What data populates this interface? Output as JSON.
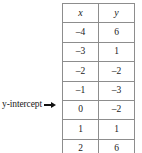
{
  "annotation": {
    "label": "y-intercept",
    "arrow_icon": "arrow-right-icon",
    "points_to_row_index": 5
  },
  "table": {
    "headers": [
      "x",
      "y"
    ],
    "rows": [
      [
        "–4",
        "6"
      ],
      [
        "–3",
        "1"
      ],
      [
        "–2",
        "–2"
      ],
      [
        "–1",
        "–3"
      ],
      [
        "0",
        "–2"
      ],
      [
        "1",
        "1"
      ],
      [
        "2",
        "6"
      ]
    ]
  },
  "colors": {
    "border": "#8d8d8d",
    "text": "#1a1a1a",
    "background": "#ffffff",
    "arrow": "#111111"
  }
}
